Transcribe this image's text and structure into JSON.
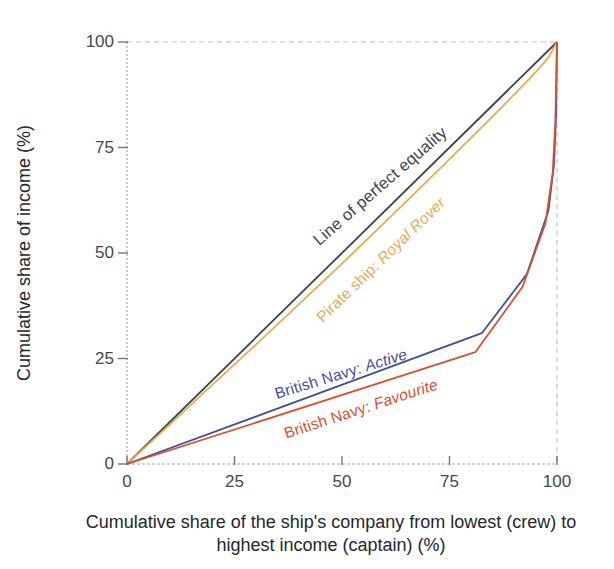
{
  "chart_data": {
    "type": "line",
    "title": "",
    "xlabel": "Cumulative share of the ship's company from lowest (crew) to highest income (captain) (%)",
    "ylabel": "Cumulative share of income (%)",
    "xlim": [
      0,
      100
    ],
    "ylim": [
      0,
      100
    ],
    "x_ticks": [
      0,
      25,
      50,
      75,
      100
    ],
    "y_ticks": [
      0,
      25,
      50,
      75,
      100
    ],
    "x_tick_labels": [
      "0",
      "25",
      "50",
      "75",
      "100"
    ],
    "y_tick_labels": [
      "100",
      "75",
      "50",
      "25",
      "0"
    ],
    "grid": "dashed reference lines at y=100 and x=100 only",
    "legend_position": "inline rotated labels alongside each curve",
    "axis_label_line1": "Cumulative share of the ship's company from lowest (crew) to",
    "axis_label_line2": "highest income (captain) (%)",
    "series": [
      {
        "name": "line-of-perfect-equality",
        "label_prefix": "Line of perfect equality",
        "label_italic": "",
        "color": "#3a4450",
        "points": [
          [
            0,
            0
          ],
          [
            100,
            100
          ]
        ]
      },
      {
        "name": "pirate-ship-royal-rover",
        "label_prefix": "Pirate ship: ",
        "label_italic": "Royal Rover",
        "color": "#eca94f",
        "points": [
          [
            0,
            0
          ],
          [
            10,
            9.4
          ],
          [
            20,
            18.9
          ],
          [
            30,
            28.3
          ],
          [
            40,
            37.9
          ],
          [
            50,
            47.5
          ],
          [
            60,
            57.3
          ],
          [
            70,
            67.2
          ],
          [
            80,
            77.3
          ],
          [
            87,
            84.4
          ],
          [
            92,
            89.6
          ],
          [
            96,
            93.9
          ],
          [
            98,
            96.3
          ],
          [
            100,
            100
          ]
        ]
      },
      {
        "name": "british-navy-active",
        "label_prefix": "British Navy: ",
        "label_italic": "Active",
        "color": "#3f4f9f",
        "points": [
          [
            0,
            0
          ],
          [
            82.5,
            31
          ],
          [
            93,
            45
          ],
          [
            98,
            60
          ],
          [
            99.3,
            71
          ],
          [
            99.8,
            83
          ],
          [
            100,
            100
          ]
        ]
      },
      {
        "name": "british-navy-favourite",
        "label_prefix": "British Navy: ",
        "label_italic": "Favourite",
        "color": "#d8502c",
        "points": [
          [
            0,
            0
          ],
          [
            81,
            26.5
          ],
          [
            92,
            42
          ],
          [
            97.3,
            57
          ],
          [
            99,
            69
          ],
          [
            99.6,
            81
          ],
          [
            100,
            100
          ]
        ]
      }
    ]
  },
  "geometry_note": "Lorenz curves of income distribution aboard ships"
}
